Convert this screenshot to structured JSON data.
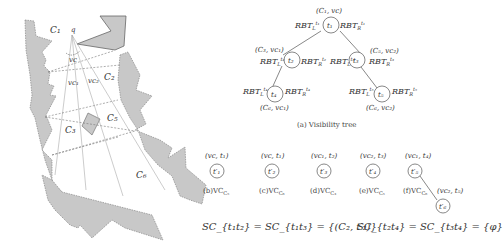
{
  "figure": {
    "map": {
      "labels": {
        "c1": "C₁",
        "c2": "C₂",
        "c3": "C₃",
        "c5": "C₅",
        "c6": "C₆",
        "q": "q",
        "vc": "vc",
        "vc1": "vc₁",
        "vc2": "vc₂"
      },
      "obstacle_fill": "#c8c8c8",
      "obstacle_stroke": "#888888"
    },
    "tree": {
      "nodes": [
        {
          "id": "t1",
          "label": "t₁",
          "state": "(C₁, vc)",
          "left": "RBT_L^{t1}",
          "right": "RBT_R^{t1}"
        },
        {
          "id": "t2",
          "label": "t₂",
          "state": "(C₃, vc₁)",
          "left": "RBT_L^{t2}",
          "right": "RBT_R^{t2}"
        },
        {
          "id": "t3",
          "label": "t₃",
          "state": "(C₅, vc₂)",
          "left": "RBT_L^{t3}",
          "right": "RBT_R^{t3}"
        },
        {
          "id": "t4",
          "label": "t₄",
          "state": "(C₆, vc₁)",
          "left": "RBT_L^{t4}",
          "right": "RBT_R^{t4}"
        },
        {
          "id": "t5",
          "label": "t₅",
          "state": "(C₆, vc₂)",
          "left": "RBT_L^{t5}",
          "right": "RBT_R^{t5}"
        }
      ],
      "rbt_text": {
        "l1": "RBT",
        "sup_l1": "t₁",
        "sub_l": "L",
        "sub_r": "R"
      },
      "caption": "(a) Visibility tree"
    },
    "vc_graphs": [
      {
        "state": "(vc, t₁)",
        "node": "t′₁",
        "caption": "(b)VC",
        "sub": "C₅"
      },
      {
        "state": "(vc, t₁)",
        "node": "t′₂",
        "caption": "(c)VC",
        "sub": "C₆"
      },
      {
        "state": "(vc₁, t₂)",
        "node": "t′₃",
        "caption": "(d)VC",
        "sub": "C₃"
      },
      {
        "state": "(vc₂, t₃)",
        "node": "t′₄",
        "caption": "(e)VC",
        "sub": "C₅"
      },
      {
        "state": "(vc₁, t₄)",
        "node": "t′₅",
        "caption": "(f)VC",
        "sub": "C₆",
        "child_state": "(vc₂, t₅)",
        "child_node": "t′₆"
      }
    ],
    "equations": {
      "eq1": "SC_{t₁t₂} = SC_{t₁t₃} = {(C₂, t′₂)}",
      "eq2": "SC_{t₂t₄} = SC_{t₃t₄} = {φ}"
    }
  }
}
